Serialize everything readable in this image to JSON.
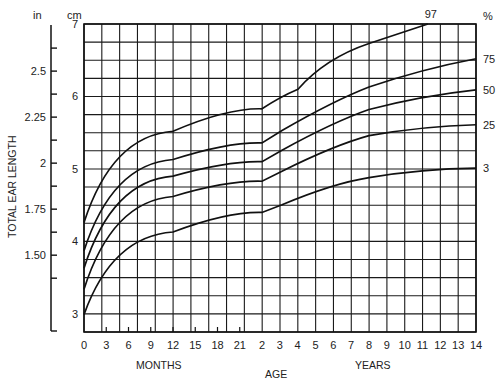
{
  "chart_data": {
    "type": "line",
    "title": "",
    "xlabel": "AGE",
    "xlabel_months": "MONTHS",
    "xlabel_years": "YEARS",
    "ylabel": "TOTAL EAR LENGTH",
    "y_unit_left_outer": "in",
    "y_unit_left_inner": "cm",
    "percentile_unit": "%",
    "ylim_cm": [
      2.75,
      7
    ],
    "x_ticks_months": [
      "0",
      "3",
      "6",
      "9",
      "12",
      "15",
      "18",
      "21"
    ],
    "x_ticks_years": [
      "2",
      "3",
      "4",
      "5",
      "6",
      "7",
      "8",
      "9",
      "10",
      "11",
      "12",
      "13",
      "14"
    ],
    "y_ticks_cm": [
      "3",
      "4",
      "5",
      "6",
      "7"
    ],
    "y_ticks_in": [
      "1.50",
      "1.75",
      "2",
      "2.25",
      "2.5"
    ],
    "grid": true,
    "x_age_points_years": [
      0,
      1,
      2,
      8,
      14
    ],
    "series": [
      {
        "name": "97",
        "values_cm": [
          4.26,
          5.52,
          5.83,
          6.73,
          null
        ],
        "reaches_top_at_years": 11.3
      },
      {
        "name": "75",
        "values_cm": [
          3.87,
          5.13,
          5.36,
          6.13,
          6.52
        ]
      },
      {
        "name": "50",
        "values_cm": [
          3.63,
          4.9,
          5.1,
          5.82,
          6.09
        ]
      },
      {
        "name": "25",
        "values_cm": [
          3.34,
          4.62,
          4.83,
          5.46,
          5.61
        ]
      },
      {
        "name": "3",
        "values_cm": [
          2.99,
          4.13,
          4.4,
          4.88,
          5.01
        ]
      }
    ]
  }
}
